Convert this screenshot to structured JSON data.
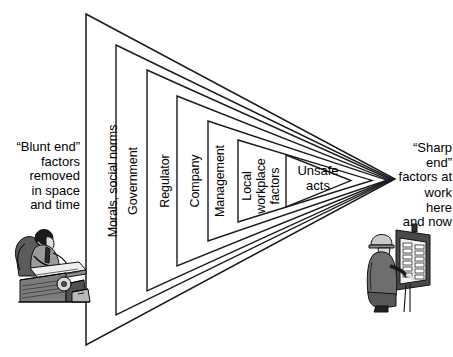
{
  "diagram": {
    "type": "nested-wedge",
    "ink_color": "#1a1a1a",
    "background": "#ffffff",
    "apex": {
      "x": 395,
      "y": 180
    },
    "layers": [
      {
        "id": "morals",
        "label": "Morals, social norms",
        "orientation": "vertical",
        "index": 0
      },
      {
        "id": "government",
        "label": "Government",
        "orientation": "vertical",
        "index": 1
      },
      {
        "id": "regulator",
        "label": "Regulator",
        "orientation": "vertical",
        "index": 2
      },
      {
        "id": "company",
        "label": "Company",
        "orientation": "vertical",
        "index": 3
      },
      {
        "id": "management",
        "label": "Management",
        "orientation": "vertical",
        "index": 4
      },
      {
        "id": "local-workplace-factors",
        "label": "Local\nworkplace\nfactors",
        "orientation": "vertical",
        "index": 5
      },
      {
        "id": "unsafe-acts",
        "label": "Unsafe\nacts",
        "orientation": "horizontal",
        "index": 6
      }
    ],
    "blunt_end": {
      "caption": "“Blunt end”\nfactors\nremoved\nin space\nand time",
      "figure": "seated-operator-at-console-icon"
    },
    "sharp_end": {
      "caption_top": "“Sharp end”\nfactors at",
      "caption_bottom": "work here\nand now",
      "figure": "worker-at-electrical-panel-icon"
    }
  }
}
